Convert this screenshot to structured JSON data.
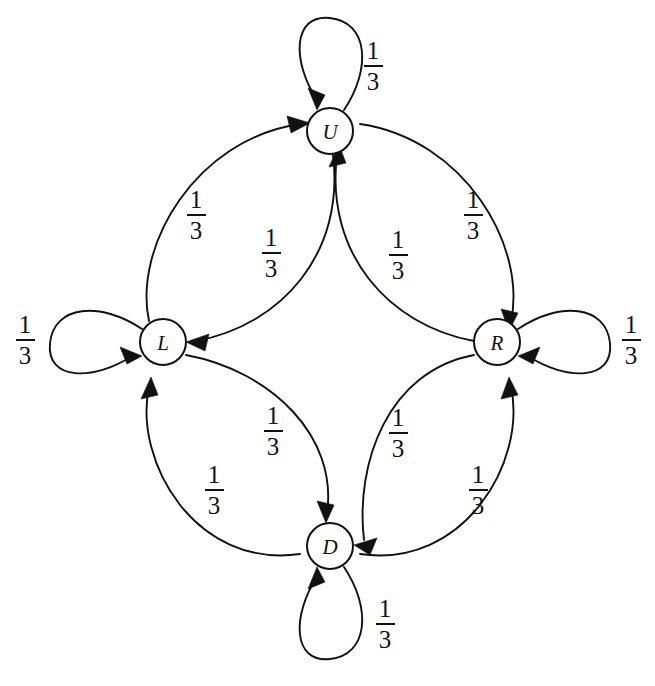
{
  "diagram": {
    "type": "state-transition-diagram",
    "background_color": "#ffffff",
    "stroke_color": "#111111",
    "nodes": [
      {
        "id": "U",
        "label": "U",
        "cx": 330,
        "cy": 131,
        "r": 23
      },
      {
        "id": "L",
        "label": "L",
        "cx": 163,
        "cy": 342,
        "r": 23
      },
      {
        "id": "R",
        "label": "R",
        "cx": 497,
        "cy": 342,
        "r": 23
      },
      {
        "id": "D",
        "label": "D",
        "cx": 330,
        "cy": 546,
        "r": 23
      }
    ],
    "self_loops": [
      {
        "id": "U-self",
        "node": "U",
        "direction": "up",
        "label": "1/3",
        "numerator": "1",
        "denominator": "3",
        "label_x": 358,
        "label_y": 38
      },
      {
        "id": "L-self",
        "node": "L",
        "direction": "left",
        "label": "1/3",
        "numerator": "1",
        "denominator": "3",
        "label_x": 10,
        "label_y": 312
      },
      {
        "id": "R-self",
        "node": "R",
        "direction": "right",
        "label": "1/3",
        "numerator": "1",
        "denominator": "3",
        "label_x": 616,
        "label_y": 312
      },
      {
        "id": "D-self",
        "node": "D",
        "direction": "down",
        "label": "1/3",
        "numerator": "1",
        "denominator": "3",
        "label_x": 370,
        "label_y": 596
      }
    ],
    "edges": [
      {
        "id": "L-to-U",
        "from": "L",
        "to": "U",
        "curve": "outer",
        "label": "1/3",
        "numerator": "1",
        "denominator": "3",
        "label_x": 181,
        "label_y": 187
      },
      {
        "id": "U-to-L",
        "from": "U",
        "to": "L",
        "curve": "inner",
        "label": "1/3",
        "numerator": "1",
        "denominator": "3",
        "label_x": 256,
        "label_y": 225
      },
      {
        "id": "U-to-R",
        "from": "U",
        "to": "R",
        "curve": "outer",
        "label": "1/3",
        "numerator": "1",
        "denominator": "3",
        "label_x": 458,
        "label_y": 187
      },
      {
        "id": "R-to-U",
        "from": "R",
        "to": "U",
        "curve": "inner",
        "label": "1/3",
        "numerator": "1",
        "denominator": "3",
        "label_x": 383,
        "label_y": 227
      },
      {
        "id": "L-to-D",
        "from": "L",
        "to": "D",
        "curve": "inner",
        "label": "1/3",
        "numerator": "1",
        "denominator": "3",
        "label_x": 258,
        "label_y": 403
      },
      {
        "id": "D-to-L",
        "from": "D",
        "to": "L",
        "curve": "outer",
        "label": "1/3",
        "numerator": "1",
        "denominator": "3",
        "label_x": 199,
        "label_y": 462
      },
      {
        "id": "R-to-D",
        "from": "R",
        "to": "D",
        "curve": "inner",
        "label": "1/3",
        "numerator": "1",
        "denominator": "3",
        "label_x": 463,
        "label_y": 462
      },
      {
        "id": "D-to-R",
        "from": "D",
        "to": "R",
        "curve": "outer",
        "label": "1/3",
        "numerator": "1",
        "denominator": "3",
        "label_x": 383,
        "label_y": 405
      }
    ],
    "transition_probability": "1/3"
  }
}
